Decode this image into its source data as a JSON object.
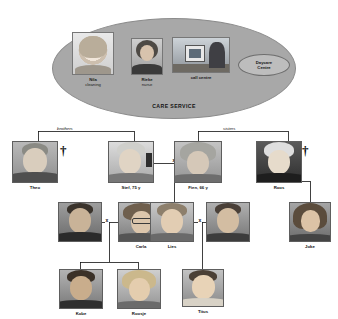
{
  "care_service": {
    "title": "CARE SERVICE",
    "members": [
      {
        "id": "nila",
        "name": "Nila",
        "role": "cleaning",
        "photo": "portrait-woman-blonde"
      },
      {
        "id": "rieke",
        "name": "Rieke",
        "role": "nurse",
        "photo": "portrait-woman-nurse"
      },
      {
        "id": "call-centre",
        "name": "call centre",
        "role": "",
        "photo": "photo-call-centre-desk"
      }
    ],
    "daycare": {
      "line1": "Daycare",
      "line2": "Centre"
    }
  },
  "genogram": {
    "relations": {
      "brothers": "brothers",
      "sisters": "sisters",
      "union_mark": "x"
    },
    "deceased_symbol": "†",
    "generation1": [
      {
        "id": "theo",
        "name": "Theo",
        "deceased": true,
        "photo": "portrait-elder-man"
      },
      {
        "id": "stef",
        "name": "Stef, 75 y",
        "deceased": false,
        "photo": "portrait-elder-man-grey"
      },
      {
        "id": "fien",
        "name": "Fien, 66 y",
        "deceased": false,
        "photo": "portrait-elder-woman-curly"
      },
      {
        "id": "roos",
        "name": "Roos",
        "deceased": true,
        "photo": "portrait-elder-woman"
      }
    ],
    "generation2": [
      {
        "id": "carla-partner",
        "name": "",
        "photo": "portrait-man-dark-hair"
      },
      {
        "id": "carla",
        "name": "Carla",
        "photo": "portrait-woman-glasses"
      },
      {
        "id": "lies",
        "name": "Lies",
        "photo": "portrait-woman-smiling"
      },
      {
        "id": "lies-partner",
        "name": "",
        "photo": "portrait-man-young"
      },
      {
        "id": "joke",
        "name": "Joke",
        "photo": "portrait-woman-long-hair"
      }
    ],
    "generation3": [
      {
        "id": "kobe",
        "name": "Kobe",
        "photo": "portrait-boy"
      },
      {
        "id": "roosje",
        "name": "Roosje",
        "photo": "portrait-girl-blonde"
      },
      {
        "id": "titus",
        "name": "Titus",
        "photo": "portrait-baby"
      }
    ]
  }
}
